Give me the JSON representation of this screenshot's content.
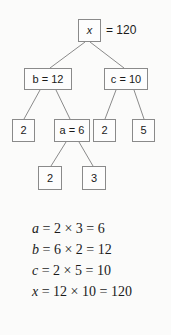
{
  "figure": {
    "background_color": "#fbfbfa",
    "box_border_color": "#8a8a8a",
    "text_color": "#1a1a1a"
  },
  "tree": {
    "root": {
      "box_label": "x",
      "external_equals": "= 120"
    },
    "level2": [
      {
        "var": "b",
        "eq": "=",
        "value": "12",
        "full": "b = 12"
      },
      {
        "var": "c",
        "eq": "=",
        "value": "10",
        "full": "c = 10"
      }
    ],
    "level3": [
      {
        "full": "2"
      },
      {
        "var": "a",
        "eq": "=",
        "value": "6",
        "full": "a = 6"
      },
      {
        "full": "2"
      },
      {
        "full": "5"
      }
    ],
    "level4": [
      {
        "full": "2"
      },
      {
        "full": "3"
      }
    ]
  },
  "equations": [
    {
      "var": "a",
      "rest": "= 2 × 3 = 6"
    },
    {
      "var": "b",
      "rest": "= 6 × 2 = 12"
    },
    {
      "var": "c",
      "rest": "= 2 × 5 = 10"
    },
    {
      "var": "x",
      "rest": "= 12 × 10 = 120"
    }
  ]
}
